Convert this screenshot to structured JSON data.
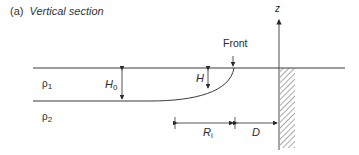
{
  "title": {
    "label": "(a)",
    "text": "Vertical section"
  },
  "labels": {
    "front": "Front",
    "z_axis": "z",
    "rho1": "ρ",
    "rho1_sub": "1",
    "rho2": "ρ",
    "rho2_sub": "2",
    "H0": "H",
    "H0_sub": "0",
    "H": "H",
    "Ri": "R",
    "Ri_sub": "i",
    "D": "D"
  },
  "colors": {
    "line": "#3a3a3a",
    "hatch": "#555555",
    "text": "#2a2a2a"
  }
}
